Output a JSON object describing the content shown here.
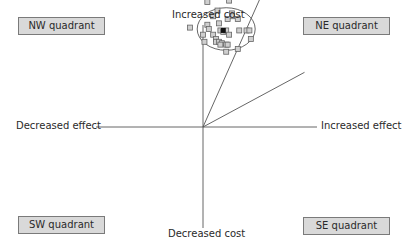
{
  "diagram": {
    "quadrants": {
      "nw": "NW quadrant",
      "ne": "NE quadrant",
      "sw": "SW quadrant",
      "se": "SE quadrant"
    },
    "axes": {
      "y_positive": "Increased cost",
      "y_negative": "Decreased cost",
      "x_negative": "Decreased effect",
      "x_positive": "Increased effect"
    },
    "colors": {
      "box_fill": "#d9d9d9",
      "box_border": "#7a7a7a",
      "line": "#555555",
      "point_fill": "#cfcfcf",
      "point_stroke": "#666666",
      "mean_point": "#111111"
    }
  },
  "chart_data": {
    "type": "scatter",
    "title": "",
    "xlabel": "Effect (Decreased effect ← → Increased effect)",
    "ylabel": "Cost (Decreased cost ↓ ↑ Increased cost)",
    "xlim": [
      -10,
      10
    ],
    "ylim": [
      -10,
      10
    ],
    "grid": false,
    "point_estimate": {
      "x": 1.4,
      "y": 6.8
    },
    "points": [
      {
        "x": -0.9,
        "y": 7.0
      },
      {
        "x": 0.3,
        "y": 8.8
      },
      {
        "x": 1.0,
        "y": 8.2
      },
      {
        "x": 1.8,
        "y": 8.9
      },
      {
        "x": 2.0,
        "y": 8.0
      },
      {
        "x": 2.0,
        "y": 7.8
      },
      {
        "x": 0.0,
        "y": 6.5
      },
      {
        "x": 0.3,
        "y": 7.2
      },
      {
        "x": 0.7,
        "y": 6.5
      },
      {
        "x": 0.7,
        "y": 7.8
      },
      {
        "x": 0.4,
        "y": 6.9
      },
      {
        "x": 0.9,
        "y": 6.2
      },
      {
        "x": 0.9,
        "y": 6.0
      },
      {
        "x": 1.1,
        "y": 6.0
      },
      {
        "x": 1.2,
        "y": 6.8
      },
      {
        "x": 1.1,
        "y": 7.3
      },
      {
        "x": 1.4,
        "y": 6.7
      },
      {
        "x": 1.6,
        "y": 6.8
      },
      {
        "x": 1.3,
        "y": 5.9
      },
      {
        "x": 1.6,
        "y": 5.8
      },
      {
        "x": 1.8,
        "y": 6.5
      },
      {
        "x": 1.7,
        "y": 7.6
      },
      {
        "x": 2.5,
        "y": 6.8
      },
      {
        "x": 2.4,
        "y": 7.6
      },
      {
        "x": 3.0,
        "y": 6.8
      },
      {
        "x": 3.2,
        "y": 6.8
      },
      {
        "x": 3.3,
        "y": 6.2
      },
      {
        "x": 1.7,
        "y": 5.8
      },
      {
        "x": 0.1,
        "y": 6.0
      },
      {
        "x": 2.4,
        "y": 5.5
      },
      {
        "x": 1.6,
        "y": 5.3
      },
      {
        "x": 1.2,
        "y": 5.8
      }
    ],
    "ellipse": {
      "cx": 1.6,
      "cy": 6.9,
      "rx": 2.0,
      "ry": 1.5
    },
    "rays": [
      {
        "label": "upper bound",
        "slope": 2.3
      },
      {
        "label": "lower bound",
        "slope": 0.55
      }
    ]
  }
}
